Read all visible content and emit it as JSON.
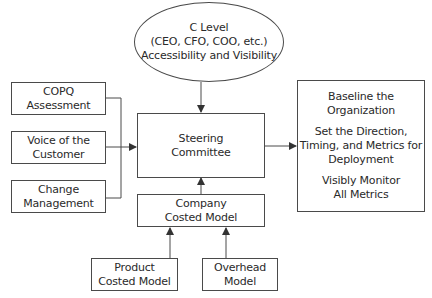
{
  "diagram": {
    "c_level": {
      "lines": [
        "C Level",
        "(CEO, CFO, COO, etc.)",
        "Accessibility and Visibility"
      ]
    },
    "inputs": [
      {
        "id": "copq",
        "lines": [
          "COPQ",
          "Assessment"
        ]
      },
      {
        "id": "voc",
        "lines": [
          "Voice of the",
          "Customer"
        ]
      },
      {
        "id": "change",
        "lines": [
          "Change",
          "Management"
        ]
      }
    ],
    "steering": {
      "lines": [
        "Steering",
        "Committee"
      ]
    },
    "company_model": {
      "lines": [
        "Company",
        "Costed Model"
      ]
    },
    "product_model": {
      "lines": [
        "Product",
        "Costed Model"
      ]
    },
    "overhead_model": {
      "lines": [
        "Overhead",
        "Model"
      ]
    },
    "outcomes": {
      "groups": [
        [
          "Baseline the",
          "Organization"
        ],
        [
          "Set the Direction,",
          "Timing, and Metrics for",
          "Deployment"
        ],
        [
          "Visibly Monitor",
          "All Metrics"
        ]
      ]
    },
    "colors": {
      "stroke": "#4a4a4a",
      "text": "#2a2a2a",
      "background": "#ffffff"
    }
  }
}
